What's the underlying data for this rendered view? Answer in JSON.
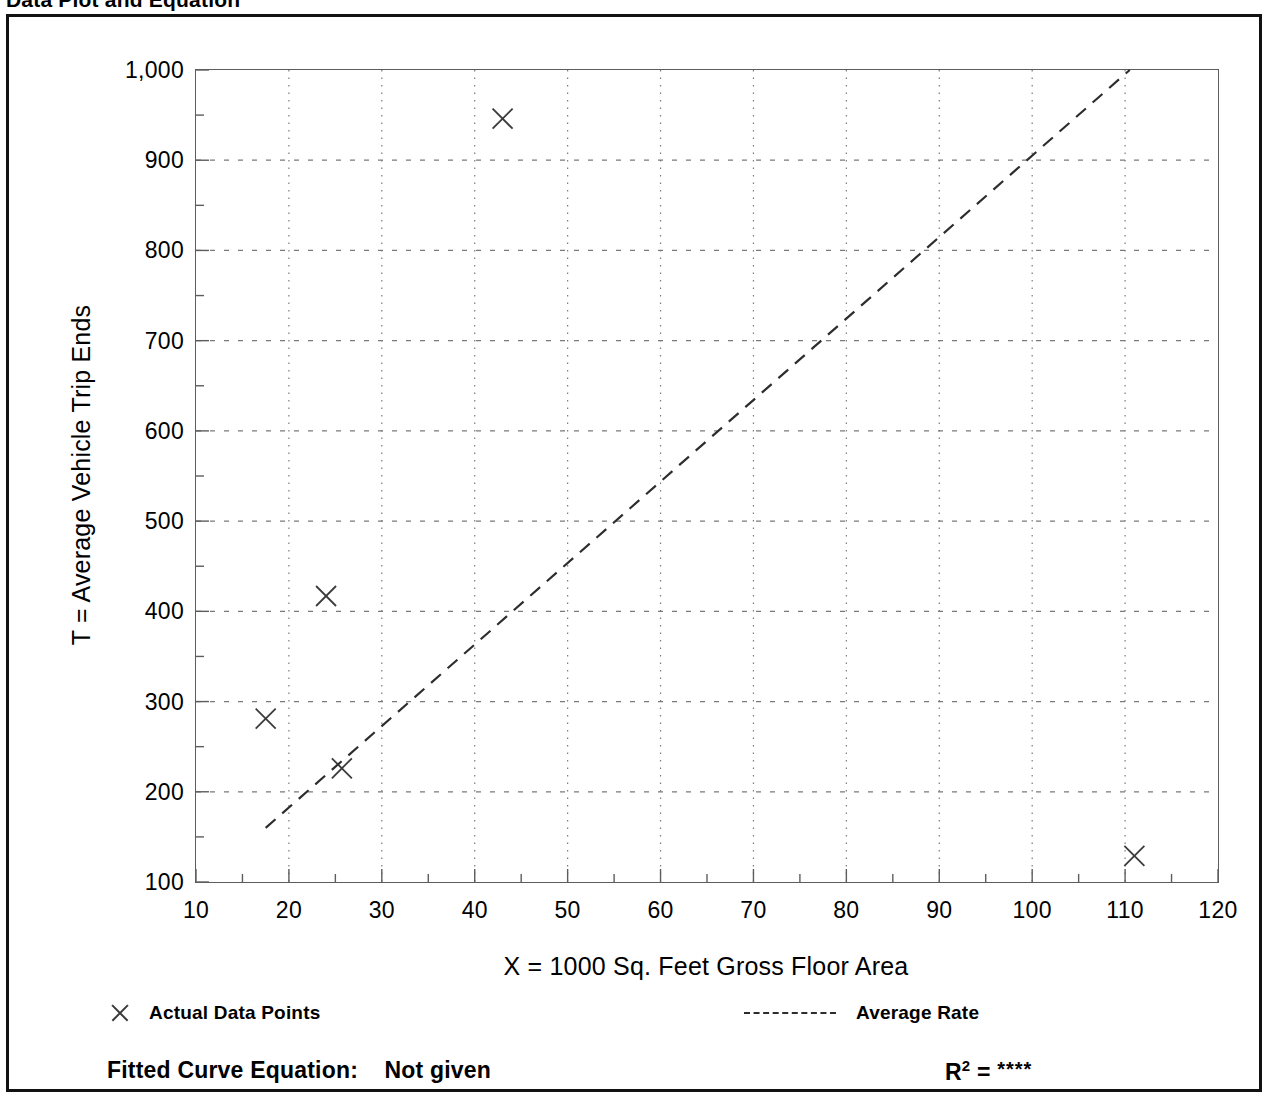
{
  "header": {
    "title": "Data Plot and Equation",
    "right_text": ""
  },
  "chart_data": {
    "type": "scatter",
    "title": "Data Plot and Equation",
    "xlabel": "X = 1000 Sq. Feet Gross Floor Area",
    "ylabel": "T = Average Vehicle Trip Ends",
    "xlim": [
      10,
      120
    ],
    "ylim": [
      100,
      1000
    ],
    "xticks": [
      10,
      20,
      30,
      40,
      50,
      60,
      70,
      80,
      90,
      100,
      110,
      120
    ],
    "xtick_labels": [
      "10",
      "20",
      "30",
      "40",
      "50",
      "60",
      "70",
      "80",
      "90",
      "100",
      "110",
      "120"
    ],
    "yticks": [
      100,
      200,
      300,
      400,
      500,
      600,
      700,
      800,
      900,
      1000
    ],
    "ytick_labels": [
      "100",
      "200",
      "300",
      "400",
      "500",
      "600",
      "700",
      "800",
      "900",
      "1,000"
    ],
    "x_minor_interval": 5,
    "y_minor_interval": 50,
    "grid": true,
    "grid_style": "dotted",
    "legend_position": "below-axes",
    "series": [
      {
        "name": "Actual Data Points",
        "marker": "x",
        "points": [
          {
            "x": 17.5,
            "y": 281
          },
          {
            "x": 24.0,
            "y": 417
          },
          {
            "x": 25.7,
            "y": 226
          },
          {
            "x": 43.0,
            "y": 946
          },
          {
            "x": 111.0,
            "y": 129
          }
        ]
      },
      {
        "name": "Average Rate",
        "style": "dashed-line",
        "x": [
          17.5,
          110.5
        ],
        "y": [
          160,
          1000
        ]
      }
    ],
    "annotations": {
      "fitted_equation_label": "Fitted Curve Equation:",
      "fitted_equation_value": "Not given",
      "r_squared_label": "R",
      "r_squared_exponent": "2",
      "r_squared_equals": " = ",
      "r_squared_value": "****"
    },
    "colors": {
      "axis": "#5d5d5d",
      "grid": "#7a7a7a",
      "marker": "#3a3a3a",
      "trend_line": "#2d2d2d",
      "frame": "#121212",
      "background": "#ffffff"
    }
  },
  "legend": {
    "data_points_label": "Actual Data Points",
    "average_rate_label": "Average Rate"
  }
}
